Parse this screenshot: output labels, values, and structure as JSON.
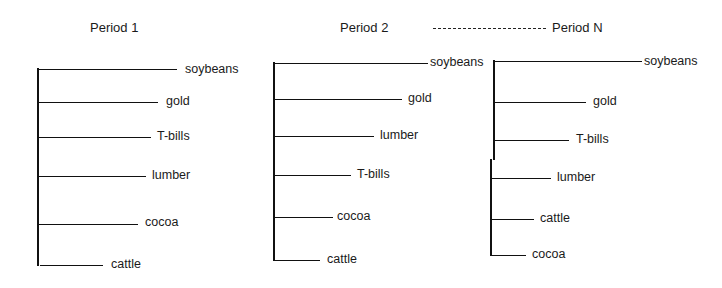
{
  "connector_label": "— — — — — — — —",
  "periods": [
    {
      "title": "Period 1",
      "items": [
        "soybeans",
        "gold",
        "T-bills",
        "lumber",
        "cocoa",
        "cattle"
      ]
    },
    {
      "title": "Period 2",
      "items": [
        "soybeans",
        "gold",
        "lumber",
        "T-bills",
        "cocoa",
        "cattle"
      ]
    },
    {
      "title": "Period N",
      "items": [
        "soybeans",
        "gold",
        "T-bills",
        "lumber",
        "cattle",
        "cocoa"
      ]
    }
  ]
}
